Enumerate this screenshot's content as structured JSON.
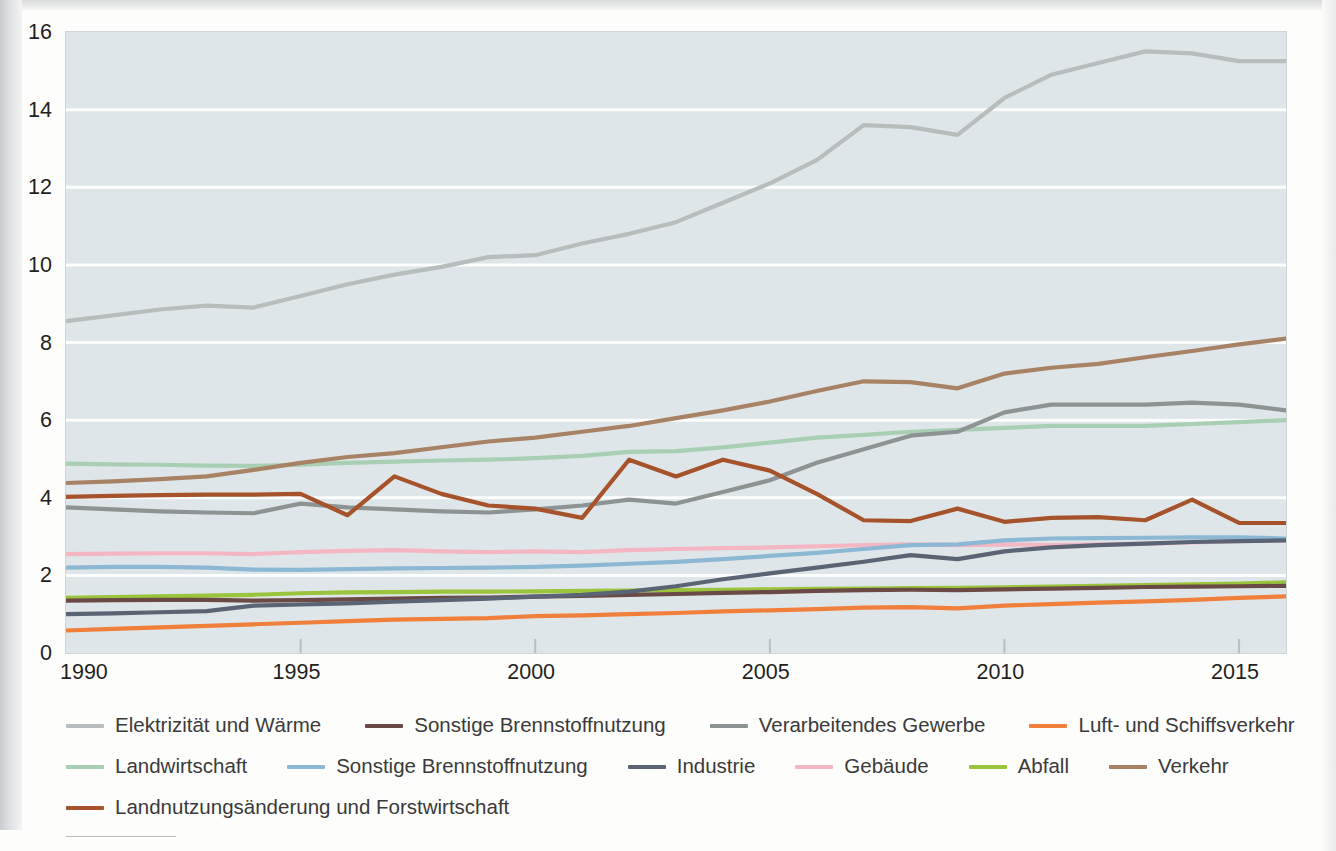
{
  "chart_data": {
    "type": "line",
    "title": "",
    "xlabel": "",
    "ylabel": "",
    "xlim": [
      1990,
      2016
    ],
    "ylim": [
      0,
      16
    ],
    "yticks": [
      0,
      2,
      4,
      6,
      8,
      10,
      12,
      14,
      16
    ],
    "xticks": [
      1990,
      1995,
      2000,
      2005,
      2010,
      2015
    ],
    "grid": "horizontal",
    "legend_position": "below",
    "plot_background": "#dfe6e9",
    "x": [
      1990,
      1991,
      1992,
      1993,
      1994,
      1995,
      1996,
      1997,
      1998,
      1999,
      2000,
      2001,
      2002,
      2003,
      2004,
      2005,
      2006,
      2007,
      2008,
      2009,
      2010,
      2011,
      2012,
      2013,
      2014,
      2015,
      2016
    ],
    "series": [
      {
        "name": "Elektrizität und Wärme",
        "color": "#b7bcbc",
        "values": [
          8.55,
          8.7,
          8.85,
          8.95,
          8.9,
          9.2,
          9.5,
          9.75,
          9.95,
          10.2,
          10.25,
          10.55,
          10.8,
          11.1,
          11.6,
          12.1,
          12.7,
          13.6,
          13.55,
          13.35,
          14.3,
          14.9,
          15.2,
          15.5,
          15.45,
          15.25,
          15.25
        ]
      },
      {
        "name": "Sonstige Brennstoffnutzung",
        "color": "#6b4a46",
        "values": [
          1.35,
          1.36,
          1.37,
          1.37,
          1.35,
          1.36,
          1.38,
          1.4,
          1.42,
          1.43,
          1.45,
          1.47,
          1.5,
          1.52,
          1.55,
          1.57,
          1.6,
          1.62,
          1.63,
          1.62,
          1.64,
          1.66,
          1.68,
          1.7,
          1.71,
          1.72,
          1.73
        ]
      },
      {
        "name": "Verarbeitendes Gewerbe",
        "color": "#8d9392",
        "values": [
          3.75,
          3.7,
          3.65,
          3.62,
          3.6,
          3.85,
          3.75,
          3.7,
          3.65,
          3.62,
          3.7,
          3.8,
          3.95,
          3.85,
          4.15,
          4.45,
          4.9,
          5.25,
          5.6,
          5.7,
          6.2,
          6.4,
          6.4,
          6.4,
          6.45,
          6.4,
          6.25
        ]
      },
      {
        "name": "Luft- und Schiffsverkehr",
        "color": "#f07f3c",
        "values": [
          0.58,
          0.62,
          0.66,
          0.7,
          0.74,
          0.78,
          0.82,
          0.86,
          0.88,
          0.9,
          0.95,
          0.97,
          1.0,
          1.03,
          1.07,
          1.1,
          1.13,
          1.17,
          1.18,
          1.15,
          1.22,
          1.26,
          1.3,
          1.33,
          1.37,
          1.42,
          1.46
        ]
      },
      {
        "name": "Landwirtschaft",
        "color": "#a8cfb4",
        "values": [
          4.88,
          4.86,
          4.85,
          4.83,
          4.82,
          4.85,
          4.9,
          4.93,
          4.96,
          4.98,
          5.02,
          5.08,
          5.18,
          5.2,
          5.3,
          5.42,
          5.55,
          5.62,
          5.7,
          5.75,
          5.8,
          5.85,
          5.85,
          5.85,
          5.9,
          5.95,
          6.0
        ]
      },
      {
        "name": "Sonstige Brennstoffnutzung",
        "color": "#8cb8d4",
        "values": [
          2.2,
          2.22,
          2.22,
          2.2,
          2.15,
          2.14,
          2.16,
          2.18,
          2.19,
          2.2,
          2.22,
          2.25,
          2.3,
          2.35,
          2.42,
          2.5,
          2.58,
          2.68,
          2.78,
          2.8,
          2.9,
          2.95,
          2.96,
          2.97,
          2.98,
          2.98,
          2.95
        ]
      },
      {
        "name": "Industrie",
        "color": "#5a6475",
        "values": [
          1.0,
          1.02,
          1.05,
          1.08,
          1.22,
          1.25,
          1.28,
          1.32,
          1.36,
          1.4,
          1.45,
          1.5,
          1.58,
          1.72,
          1.9,
          2.05,
          2.2,
          2.35,
          2.52,
          2.42,
          2.62,
          2.72,
          2.78,
          2.82,
          2.86,
          2.88,
          2.9
        ]
      },
      {
        "name": "Gebäude",
        "color": "#f4b6c2",
        "values": [
          2.55,
          2.56,
          2.57,
          2.57,
          2.55,
          2.6,
          2.63,
          2.65,
          2.62,
          2.6,
          2.62,
          2.6,
          2.65,
          2.68,
          2.7,
          2.72,
          2.75,
          2.78,
          2.8,
          2.78,
          2.8,
          2.78,
          2.8,
          2.82,
          2.85,
          2.88,
          2.9
        ]
      },
      {
        "name": "Abfall",
        "color": "#9ac43c",
        "values": [
          1.42,
          1.44,
          1.46,
          1.48,
          1.5,
          1.54,
          1.56,
          1.57,
          1.58,
          1.58,
          1.59,
          1.6,
          1.61,
          1.62,
          1.63,
          1.64,
          1.65,
          1.66,
          1.67,
          1.68,
          1.69,
          1.71,
          1.73,
          1.75,
          1.77,
          1.79,
          1.82
        ]
      },
      {
        "name": "Verkehr",
        "color": "#a88264",
        "values": [
          4.38,
          4.42,
          4.48,
          4.55,
          4.72,
          4.9,
          5.05,
          5.15,
          5.3,
          5.45,
          5.55,
          5.7,
          5.85,
          6.05,
          6.25,
          6.48,
          6.75,
          7.0,
          6.98,
          6.82,
          7.2,
          7.35,
          7.45,
          7.62,
          7.78,
          7.95,
          8.1
        ]
      },
      {
        "name": "Landnutzungsänderung und Forstwirtschaft",
        "color": "#a6522b",
        "values": [
          4.02,
          4.05,
          4.07,
          4.08,
          4.08,
          4.1,
          3.55,
          4.55,
          4.1,
          3.8,
          3.72,
          3.48,
          4.98,
          4.55,
          4.98,
          4.7,
          4.1,
          3.42,
          3.4,
          3.72,
          3.38,
          3.48,
          3.5,
          3.42,
          3.95,
          3.35,
          3.35
        ]
      }
    ]
  },
  "axes": {
    "y_ticks": [
      "16",
      "14",
      "12",
      "10",
      "8",
      "6",
      "4",
      "2",
      "0"
    ],
    "x_ticks": [
      "1990",
      "1995",
      "2000",
      "2005",
      "2010",
      "2015"
    ]
  },
  "legend": {
    "rows": [
      [
        {
          "label": "Elektrizität und Wärme",
          "color": "#b7bcbc"
        },
        {
          "label": "Sonstige Brennstoffnutzung",
          "color": "#6b4a46"
        },
        {
          "label": "Verarbeitendes Gewerbe",
          "color": "#8d9392"
        },
        {
          "label": "Luft- und Schiffsverkehr",
          "color": "#f07f3c"
        }
      ],
      [
        {
          "label": "Landwirtschaft",
          "color": "#a8cfb4"
        },
        {
          "label": "Sonstige Brennstoffnutzung",
          "color": "#8cb8d4"
        },
        {
          "label": "Industrie",
          "color": "#5a6475"
        },
        {
          "label": "Gebäude",
          "color": "#f4b6c2"
        },
        {
          "label": "Abfall",
          "color": "#9ac43c"
        },
        {
          "label": "Verkehr",
          "color": "#a88264"
        }
      ],
      [
        {
          "label": "Landnutzungsänderung und Forstwirtschaft",
          "color": "#a6522b"
        }
      ]
    ]
  }
}
